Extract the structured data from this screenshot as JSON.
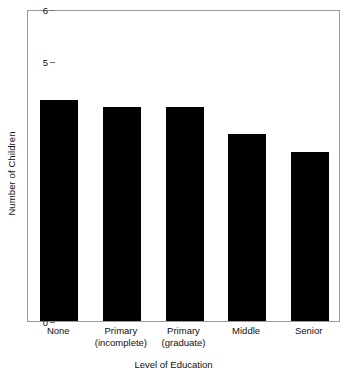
{
  "chart_data": {
    "type": "bar",
    "title": "",
    "xlabel": "Level of Education",
    "ylabel": "Number of Children",
    "categories": [
      "None",
      "Primary (incomplete)",
      "Primary (graduate)",
      "Middle",
      "Senior"
    ],
    "category_lines": [
      {
        "line1": "None",
        "line2": ""
      },
      {
        "line1": "Primary",
        "line2": "(incomplete)"
      },
      {
        "line1": "Primary",
        "line2": "(graduate)"
      },
      {
        "line1": "Middle",
        "line2": ""
      },
      {
        "line1": "Senior",
        "line2": ""
      }
    ],
    "values": [
      4.25,
      4.12,
      4.12,
      3.6,
      3.25
    ],
    "ylim": [
      0,
      6
    ],
    "yticks": [
      0,
      1,
      2,
      3,
      4,
      5,
      6
    ],
    "ytick_labels": [
      "0",
      "1",
      "2",
      "3",
      "4",
      "5",
      "6"
    ],
    "grid": false,
    "legend": false,
    "bar_color": "#000000",
    "frame_color": "#9a9a9a",
    "background": "#ffffff"
  }
}
